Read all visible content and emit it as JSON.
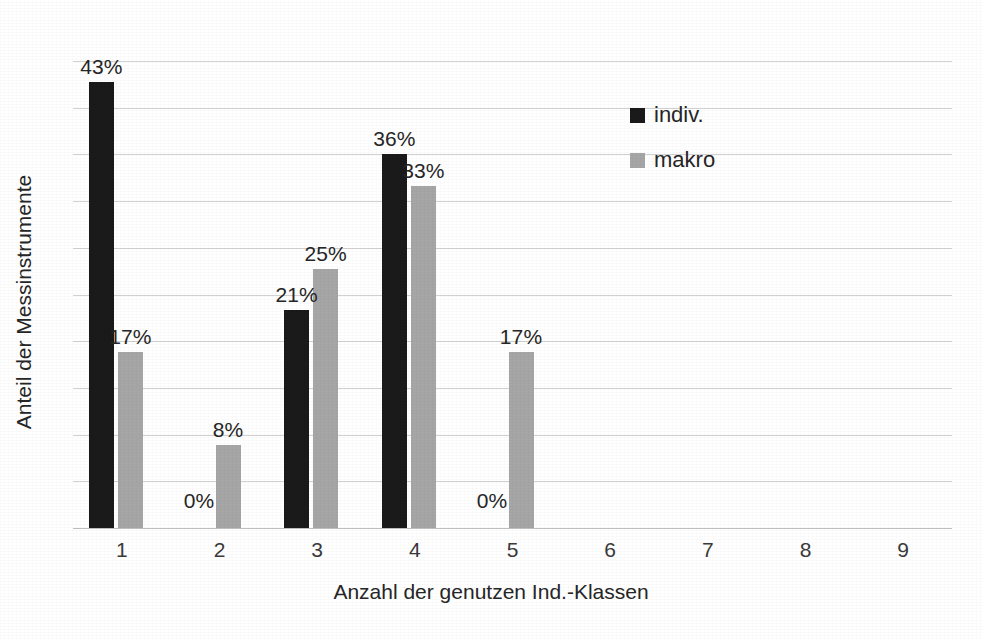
{
  "chart_data": {
    "type": "bar",
    "title": "",
    "subtitle": "",
    "xlabel": "Anzahl der genutzen Ind.-Klassen",
    "ylabel": "Anteil der Messinstrumente",
    "categories": [
      "1",
      "2",
      "3",
      "4",
      "5",
      "6",
      "7",
      "8",
      "9"
    ],
    "series": [
      {
        "name": "indiv.",
        "color": "#1a1a1a",
        "values": [
          43,
          0,
          21,
          36,
          0,
          null,
          null,
          null,
          null
        ],
        "labels": [
          "43%",
          "0%",
          "21%",
          "36%",
          "0%",
          "",
          "",
          "",
          ""
        ]
      },
      {
        "name": "makro",
        "color": "#a6a6a6",
        "values": [
          17,
          8,
          25,
          33,
          17,
          null,
          null,
          null,
          null
        ],
        "labels": [
          "17%",
          "8%",
          "25%",
          "33%",
          "17%",
          "",
          "",
          "",
          ""
        ]
      }
    ],
    "ylim": [
      0,
      45
    ],
    "ytick_labels": [],
    "grid": true,
    "gridline_count": 10,
    "legend_position": "inside-top-right",
    "value_suffix": "%"
  },
  "axis": {
    "x_title": "Anzahl der genutzen Ind.-Klassen",
    "y_title": "Anteil der Messinstrumente",
    "ticks": [
      "1",
      "2",
      "3",
      "4",
      "5",
      "6",
      "7",
      "8",
      "9"
    ]
  },
  "legend": {
    "items": [
      {
        "label": "indiv.",
        "color": "#1a1a1a"
      },
      {
        "label": "makro",
        "color": "#a6a6a6"
      }
    ]
  },
  "colors": {
    "series_indiv": "#1a1a1a",
    "series_makro": "#a6a6a6",
    "gridline": "#c9c9c9",
    "text": "#262626",
    "background": "#ffffff"
  }
}
